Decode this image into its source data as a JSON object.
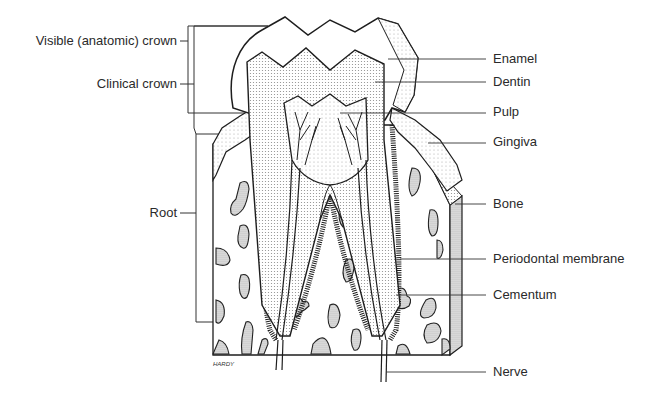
{
  "diagram": {
    "left_labels": [
      {
        "id": "visible-crown",
        "text": "Visible (anatomic) crown"
      },
      {
        "id": "clinical-crown",
        "text": "Clinical crown"
      },
      {
        "id": "root",
        "text": "Root"
      }
    ],
    "right_labels": [
      {
        "id": "enamel",
        "text": "Enamel"
      },
      {
        "id": "dentin",
        "text": "Dentin"
      },
      {
        "id": "pulp",
        "text": "Pulp"
      },
      {
        "id": "gingiva",
        "text": "Gingiva"
      },
      {
        "id": "bone",
        "text": "Bone"
      },
      {
        "id": "periodontal-membrane",
        "text": "Periodontal membrane"
      },
      {
        "id": "cementum",
        "text": "Cementum"
      },
      {
        "id": "nerve",
        "text": "Nerve"
      }
    ],
    "signature": "HARDY"
  },
  "colors": {
    "line": "#1e1e1e",
    "stipple": "#bdbdbd",
    "background": "#ffffff"
  }
}
